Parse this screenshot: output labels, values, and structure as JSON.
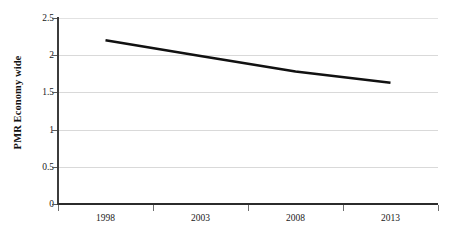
{
  "chart_data": {
    "type": "line",
    "title": "",
    "xlabel": "",
    "ylabel": "PMR Economy wide",
    "categories": [
      "1998",
      "2003",
      "2008",
      "2013"
    ],
    "series": [
      {
        "name": "PMR Economy wide",
        "values": [
          2.2,
          1.99,
          1.78,
          1.63
        ],
        "color": "#111111",
        "line_width": 2.6
      }
    ],
    "ylim": [
      0,
      2.5
    ],
    "yticks": [
      0,
      0.5,
      1,
      1.5,
      2,
      2.5
    ],
    "ytick_labels": [
      "0",
      "0.5",
      "1",
      "1.5",
      "2",
      "2.5"
    ],
    "xtick_labels": [
      "1998",
      "2003",
      "2008",
      "2013"
    ],
    "grid": true,
    "grid_axis": "y",
    "grid_color": "#d9d9d9",
    "legend": false,
    "legend_position": "none",
    "background": "#ffffff",
    "axis_color": "#2b2b2b"
  },
  "axes": {
    "y_title": "PMR Economy wide"
  }
}
